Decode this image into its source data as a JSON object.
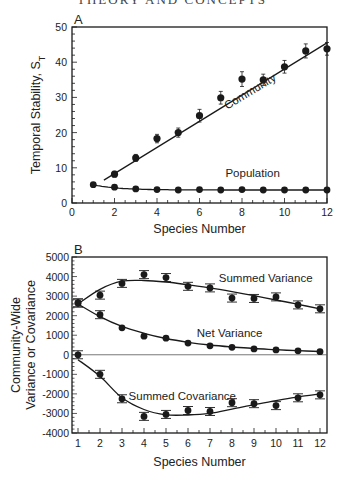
{
  "page_header": "THEORY AND CONCEPTS",
  "chart_data": [
    {
      "panel": "A",
      "type": "scatter",
      "title": "",
      "xlabel": "Species Number",
      "ylabel": "Temporal Stability, S_T",
      "xlim": [
        0,
        12
      ],
      "ylim": [
        0,
        50
      ],
      "xticks": [
        0,
        2,
        4,
        6,
        8,
        10,
        12
      ],
      "yticks": [
        0,
        10,
        20,
        30,
        40,
        50
      ],
      "grid": false,
      "series": [
        {
          "name": "Community",
          "x": [
            2,
            3,
            4,
            5,
            6,
            7,
            8,
            9,
            10,
            11,
            12
          ],
          "values": [
            8.2,
            12.8,
            18.3,
            20.0,
            24.8,
            29.9,
            35.2,
            35.0,
            38.7,
            43.2,
            43.8
          ],
          "error": [
            0.8,
            1.0,
            1.2,
            1.3,
            1.8,
            1.8,
            2.1,
            1.6,
            1.8,
            2.0,
            1.8
          ],
          "fit_line": {
            "type": "linear",
            "x": [
              1.5,
              12
            ],
            "y": [
              6.5,
              45.5
            ]
          },
          "label": "Community"
        },
        {
          "name": "Population",
          "x": [
            1,
            2,
            3,
            4,
            5,
            6,
            7,
            8,
            9,
            10,
            11,
            12
          ],
          "values": [
            5.2,
            4.5,
            4.0,
            3.8,
            3.7,
            3.8,
            3.7,
            3.8,
            3.7,
            3.7,
            3.7,
            3.7
          ],
          "fit_line": {
            "type": "curve"
          },
          "label": "Population"
        }
      ]
    },
    {
      "panel": "B",
      "type": "scatter",
      "title": "",
      "xlabel": "Species Number",
      "ylabel": "Community-Wide Variance or Covariance",
      "xlim": [
        0.75,
        12.3
      ],
      "ylim": [
        -4000,
        5000
      ],
      "xticks": [
        1,
        2,
        3,
        4,
        5,
        6,
        7,
        8,
        9,
        10,
        11,
        12
      ],
      "yticks": [
        5000,
        4000,
        3000,
        2000,
        1000,
        0,
        -1000,
        -2000,
        -3000,
        -4000
      ],
      "grid": false,
      "zero_line": true,
      "series": [
        {
          "name": "Summed Variance",
          "x": [
            1,
            2,
            3,
            4,
            5,
            6,
            7,
            8,
            9,
            10,
            11,
            12
          ],
          "values": [
            2650,
            3050,
            3650,
            4100,
            3950,
            3500,
            3420,
            2900,
            2880,
            2960,
            2550,
            2350
          ],
          "fit": [
            2600,
            3350,
            3760,
            3800,
            3720,
            3580,
            3420,
            3230,
            3020,
            2800,
            2580,
            2350
          ],
          "label": "Summed Variance"
        },
        {
          "name": "Net Variance",
          "x": [
            1,
            2,
            3,
            4,
            5,
            6,
            7,
            8,
            9,
            10,
            11,
            12
          ],
          "values": [
            2650,
            2050,
            1380,
            950,
            850,
            600,
            460,
            380,
            300,
            250,
            200,
            160
          ],
          "fit": [
            2600,
            1950,
            1450,
            1100,
            830,
            640,
            500,
            400,
            320,
            260,
            210,
            170
          ],
          "label": "Net Variance"
        },
        {
          "name": "Summed Covariance",
          "x": [
            1,
            2,
            3,
            4,
            5,
            6,
            7,
            8,
            9,
            10,
            11,
            12
          ],
          "values": [
            0,
            -1000,
            -2250,
            -3150,
            -3050,
            -2850,
            -2900,
            -2450,
            -2500,
            -2600,
            -2200,
            -2050
          ],
          "fit": [
            -250,
            -1100,
            -2200,
            -2800,
            -3070,
            -3080,
            -3000,
            -2780,
            -2550,
            -2350,
            -2150,
            -2000
          ],
          "label": "Summed Covariance"
        }
      ]
    }
  ]
}
